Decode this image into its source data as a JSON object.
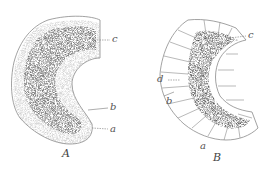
{
  "figure": {
    "panels": [
      {
        "id": "A",
        "caption": "A",
        "labels": {
          "c": "c",
          "b": "b",
          "a": "a"
        }
      },
      {
        "id": "B",
        "caption": "B",
        "labels": {
          "c": "c",
          "d": "d",
          "b": "b",
          "a": "a"
        }
      }
    ],
    "colors": {
      "outline": "#8a8a8a",
      "stipple": "#555555",
      "background": "#ffffff"
    }
  }
}
